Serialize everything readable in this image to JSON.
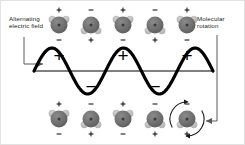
{
  "diagram": {
    "background_color": "#ffffff",
    "border_color": "#e2e2e2"
  },
  "labels": {
    "left": {
      "text": "Alternating\nelectric field",
      "name": "alternating-electric-field-label",
      "color": "#231f20"
    },
    "right": {
      "text": "Molecular\nrotation",
      "name": "molecular-rotation-label",
      "color": "#231f20"
    }
  },
  "wave": {
    "name": "alternating-electric-field-wave",
    "color": "#000000",
    "stroke_width": 3.2,
    "baseline_y": 70,
    "amplitude": 23,
    "cycles": 2.5,
    "x_start": 33,
    "x_end": 212,
    "crest_labels": [
      "+",
      "+",
      "+"
    ],
    "trough_labels": [
      "−",
      "−"
    ],
    "crest_x": [
      58,
      122,
      186
    ],
    "trough_x": [
      90,
      154
    ],
    "sign_color": "#000000",
    "baseline_color": "#000000"
  },
  "molecules": {
    "body_color": "#6e6e6e",
    "lobe_color": "#b9b9b9",
    "body_radius": 8.5,
    "lobe_radius": 3.6,
    "charge_color": "#1a1a1a",
    "top_row": [
      {
        "x": 58,
        "y": 24,
        "orientation": "up",
        "plus_at": "top",
        "minus_at": "bottom"
      },
      {
        "x": 90,
        "y": 24,
        "orientation": "down",
        "plus_at": "bottom",
        "minus_at": "top"
      },
      {
        "x": 122,
        "y": 24,
        "orientation": "up",
        "plus_at": "top",
        "minus_at": "bottom"
      },
      {
        "x": 154,
        "y": 24,
        "orientation": "down",
        "plus_at": "bottom",
        "minus_at": "top"
      },
      {
        "x": 186,
        "y": 24,
        "orientation": "up",
        "plus_at": "top",
        "minus_at": "bottom"
      }
    ],
    "bottom_row": [
      {
        "x": 58,
        "y": 118,
        "orientation": "up",
        "plus_at": "top",
        "minus_at": "bottom"
      },
      {
        "x": 90,
        "y": 118,
        "orientation": "down",
        "plus_at": "bottom",
        "minus_at": "top"
      },
      {
        "x": 122,
        "y": 118,
        "orientation": "up",
        "plus_at": "top",
        "minus_at": "bottom"
      },
      {
        "x": 154,
        "y": 118,
        "orientation": "down",
        "plus_at": "bottom",
        "minus_at": "top"
      },
      {
        "x": 186,
        "y": 118,
        "orientation": "down",
        "plus_at": "bottom",
        "minus_at": "top",
        "rotating": true
      }
    ]
  },
  "leaders": {
    "left": {
      "name": "left-leader-arrow",
      "color": "#58595b",
      "path": "M 23 36 L 23 63 L 42 63",
      "arrow_at": "right"
    },
    "right": {
      "name": "right-leader-arrow",
      "color": "#58595b",
      "path": "M 216 34 L 216 120 L 205 120",
      "arrow_at": "left"
    }
  },
  "rotation_indicator": {
    "name": "rotation-arc-arrows",
    "color": "#1a1a1a",
    "radius": 17,
    "center_x": 186,
    "center_y": 118
  }
}
